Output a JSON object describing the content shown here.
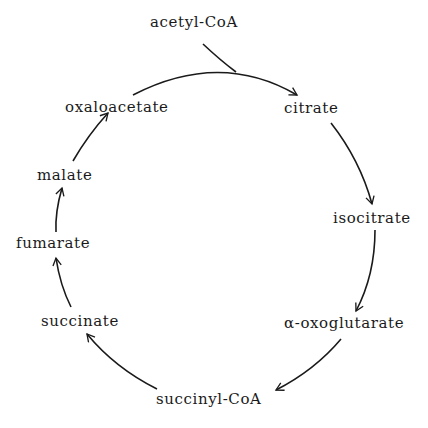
{
  "diagram": {
    "title": "",
    "type": "cycle",
    "nodes": [
      {
        "id": "acetyl-coa",
        "label": "acetyl-CoA"
      },
      {
        "id": "citrate",
        "label": "citrate"
      },
      {
        "id": "isocitrate",
        "label": "isocitrate"
      },
      {
        "id": "oxoglutarate",
        "label": "α-oxoglutarate"
      },
      {
        "id": "succinyl-coa",
        "label": "succinyl-CoA"
      },
      {
        "id": "succinate",
        "label": "succinate"
      },
      {
        "id": "fumarate",
        "label": "fumarate"
      },
      {
        "id": "malate",
        "label": "malate"
      },
      {
        "id": "oxaloacetate",
        "label": "oxaloacetate"
      }
    ],
    "edges": [
      {
        "from": "oxaloacetate",
        "to": "citrate",
        "joined_by": "acetyl-CoA"
      },
      {
        "from": "citrate",
        "to": "isocitrate"
      },
      {
        "from": "isocitrate",
        "to": "oxoglutarate"
      },
      {
        "from": "oxoglutarate",
        "to": "succinyl-coa"
      },
      {
        "from": "succinyl-coa",
        "to": "succinate"
      },
      {
        "from": "succinate",
        "to": "fumarate"
      },
      {
        "from": "fumarate",
        "to": "malate"
      },
      {
        "from": "malate",
        "to": "oxaloacetate"
      }
    ],
    "colors": {
      "ink": "#1a1a1a",
      "background": "#ffffff"
    }
  }
}
